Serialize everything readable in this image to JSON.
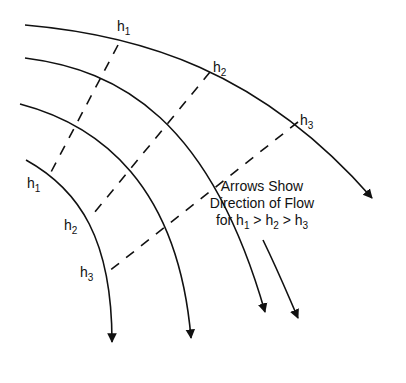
{
  "diagram": {
    "caption": {
      "line1": "Arrows Show",
      "line2": "Direction of Flow",
      "line3_prefix": "for ",
      "h": "h",
      "s1": "1",
      "s2": "2",
      "s3": "3",
      "gt": " > "
    },
    "equipotential_labels": [
      {
        "base": "h",
        "sub": "1",
        "x": 117,
        "y": 19
      },
      {
        "base": "h",
        "sub": "2",
        "x": 213,
        "y": 60
      },
      {
        "base": "h",
        "sub": "3",
        "x": 300,
        "y": 113
      },
      {
        "base": "h",
        "sub": "1",
        "x": 27,
        "y": 176
      },
      {
        "base": "h",
        "sub": "2",
        "x": 64,
        "y": 218
      },
      {
        "base": "h",
        "sub": "3",
        "x": 80,
        "y": 265
      }
    ],
    "flow_lines": [
      {
        "name": "flow-line-1",
        "path": "M25,25 C140,35 260,70 372,198"
      },
      {
        "name": "flow-line-2",
        "path": "M25,58 C120,70 210,120 265,312"
      },
      {
        "name": "flow-line-3",
        "path": "M20,104 C100,125 178,185 191,338"
      },
      {
        "name": "flow-line-4",
        "path": "M26,160 C80,190 112,240 112,342"
      }
    ],
    "equipotential_lines": [
      {
        "name": "equipotential-h1",
        "x1": 118,
        "y1": 45,
        "x2": 50,
        "y2": 174
      },
      {
        "name": "equipotential-h2",
        "x1": 210,
        "y1": 72,
        "x2": 90,
        "y2": 218
      },
      {
        "name": "equipotential-h3",
        "x1": 298,
        "y1": 122,
        "x2": 108,
        "y2": 272
      }
    ],
    "free_arrow": {
      "path": "M263,240 C280,275 290,300 298,318"
    },
    "colors": {
      "line": "#111111",
      "background": "#ffffff"
    }
  }
}
